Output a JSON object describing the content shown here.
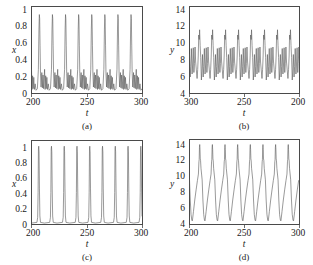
{
  "figure": {
    "panels": [
      {
        "id": "a",
        "label": "(a)",
        "xlabel": "t",
        "ylabel": "x",
        "xticks": [
          "200",
          "250",
          "300"
        ],
        "yticks": [
          "0",
          "0.2",
          "0.4",
          "0.6",
          "0.8",
          "1"
        ],
        "reversed_x": false
      },
      {
        "id": "b",
        "label": "(b)",
        "xlabel": "t",
        "ylabel": "y",
        "xticks": [
          "300",
          "250",
          "200"
        ],
        "yticks": [
          "4",
          "6",
          "8",
          "10",
          "12",
          "14"
        ],
        "reversed_x": true
      },
      {
        "id": "c",
        "label": "(c)",
        "xlabel": "t",
        "ylabel": "x",
        "xticks": [
          "200",
          "250",
          "300"
        ],
        "yticks": [
          "0",
          "0.2",
          "0.4",
          "0.6",
          "0.8",
          "1"
        ],
        "reversed_x": false
      },
      {
        "id": "d",
        "label": "(d)",
        "xlabel": "t",
        "ylabel": "y",
        "xticks": [
          "200",
          "250",
          "300"
        ],
        "yticks": [
          "4",
          "6",
          "8",
          "10",
          "12",
          "14"
        ],
        "reversed_x": false
      }
    ]
  },
  "chart_data": [
    {
      "type": "line",
      "panel": "a",
      "title": "",
      "xlabel": "t",
      "ylabel": "x",
      "xlim": [
        200,
        300
      ],
      "ylim": [
        0,
        1.08
      ],
      "xticks": [
        200,
        250,
        300
      ],
      "yticks": [
        0,
        0.2,
        0.4,
        0.6,
        0.8,
        1
      ],
      "grid": false,
      "legend": false,
      "description": "Eight large spikes reaching ~0.95-1.0 separated by low-amplitude double bumps near 0.15-0.25; period about 11.8 time units.",
      "series": [
        {
          "name": "x(t)",
          "color": "#555555",
          "period": 11.8,
          "waveform_cycle": [
            {
              "dt": 0.0,
              "y": 0.3
            },
            {
              "dt": 0.45,
              "y": 0.05
            },
            {
              "dt": 1.0,
              "y": 0.22
            },
            {
              "dt": 1.5,
              "y": 0.06
            },
            {
              "dt": 2.05,
              "y": 0.2
            },
            {
              "dt": 2.6,
              "y": 0.05
            },
            {
              "dt": 3.3,
              "y": 0.12
            },
            {
              "dt": 4.1,
              "y": 0.04
            },
            {
              "dt": 5.3,
              "y": 0.06
            },
            {
              "dt": 6.2,
              "y": 0.3
            },
            {
              "dt": 6.7,
              "y": 0.8
            },
            {
              "dt": 7.05,
              "y": 0.98
            },
            {
              "dt": 7.35,
              "y": 0.93
            },
            {
              "dt": 7.7,
              "y": 0.6
            },
            {
              "dt": 8.1,
              "y": 0.25
            },
            {
              "dt": 8.6,
              "y": 0.08
            },
            {
              "dt": 9.3,
              "y": 0.26
            },
            {
              "dt": 9.8,
              "y": 0.07
            },
            {
              "dt": 10.4,
              "y": 0.23
            },
            {
              "dt": 10.9,
              "y": 0.06
            },
            {
              "dt": 11.8,
              "y": 0.3
            }
          ]
        }
      ]
    },
    {
      "type": "line",
      "panel": "b",
      "title": "",
      "xlabel": "t",
      "ylabel": "y",
      "xlim": [
        300,
        200
      ],
      "ylim": [
        3.4,
        15.0
      ],
      "xticks": [
        300,
        250,
        200
      ],
      "yticks": [
        4,
        6,
        8,
        10,
        12,
        14
      ],
      "grid": false,
      "legend": false,
      "axis_note": "x axis is reversed, running from 300 on the left to 200 on the right",
      "description": "Irregular multi-peak oscillation: one tall peak near 12 followed by two or three intermediate peaks near 10, with troughs between 5 and 6.5; repeat interval about 11.8 units.",
      "series": [
        {
          "name": "y(t)",
          "color": "#555555",
          "period": 11.8,
          "waveform_cycle": [
            {
              "dt": 0.0,
              "y": 7.6
            },
            {
              "dt": 0.55,
              "y": 9.6
            },
            {
              "dt": 1.1,
              "y": 7.4
            },
            {
              "dt": 1.6,
              "y": 6.2
            },
            {
              "dt": 2.2,
              "y": 9.5
            },
            {
              "dt": 2.75,
              "y": 7.2
            },
            {
              "dt": 3.25,
              "y": 6.0
            },
            {
              "dt": 3.9,
              "y": 9.4
            },
            {
              "dt": 4.45,
              "y": 7.0
            },
            {
              "dt": 4.95,
              "y": 5.6
            },
            {
              "dt": 5.6,
              "y": 8.6
            },
            {
              "dt": 6.1,
              "y": 6.4
            },
            {
              "dt": 6.6,
              "y": 5.2
            },
            {
              "dt": 7.2,
              "y": 8.2
            },
            {
              "dt": 7.7,
              "y": 9.8
            },
            {
              "dt": 8.2,
              "y": 11.9
            },
            {
              "dt": 8.55,
              "y": 10.6
            },
            {
              "dt": 9.0,
              "y": 11.2
            },
            {
              "dt": 9.45,
              "y": 8.4
            },
            {
              "dt": 9.95,
              "y": 6.6
            },
            {
              "dt": 10.5,
              "y": 5.4
            },
            {
              "dt": 11.1,
              "y": 6.4
            },
            {
              "dt": 11.8,
              "y": 7.6
            }
          ]
        }
      ]
    },
    {
      "type": "line",
      "panel": "c",
      "title": "",
      "xlabel": "t",
      "ylabel": "x",
      "xlim": [
        200,
        300
      ],
      "ylim": [
        0,
        1.18
      ],
      "xticks": [
        200,
        250,
        300
      ],
      "yticks": [
        0,
        0.2,
        0.4,
        0.6,
        0.8,
        1
      ],
      "grid": false,
      "legend": false,
      "description": "Nine clean narrow spikes peaking slightly above 1.0 on a flat near-zero baseline; regular period about 11.5 time units, no secondary bumps.",
      "series": [
        {
          "name": "x(t)",
          "color": "#555555",
          "period": 11.5,
          "waveform_cycle": [
            {
              "dt": 0.0,
              "y": 0.02
            },
            {
              "dt": 4.9,
              "y": 0.03
            },
            {
              "dt": 5.55,
              "y": 0.1
            },
            {
              "dt": 5.95,
              "y": 0.45
            },
            {
              "dt": 6.25,
              "y": 1.06
            },
            {
              "dt": 6.5,
              "y": 1.1
            },
            {
              "dt": 6.8,
              "y": 1.02
            },
            {
              "dt": 7.15,
              "y": 0.5
            },
            {
              "dt": 7.55,
              "y": 0.12
            },
            {
              "dt": 8.1,
              "y": 0.03
            },
            {
              "dt": 11.5,
              "y": 0.02
            }
          ]
        }
      ]
    },
    {
      "type": "line",
      "panel": "d",
      "title": "",
      "xlabel": "t",
      "ylabel": "y",
      "xlim": [
        200,
        300
      ],
      "ylim": [
        3.2,
        15.0
      ],
      "xticks": [
        200,
        250,
        300
      ],
      "yticks": [
        4,
        6,
        8,
        10,
        12,
        14
      ],
      "grid": false,
      "legend": false,
      "description": "Regular sawtooth-like relaxation oscillation: slow rise from about 3.7 to a sharp narrow peak near 14.3, then rapid fall with a small notch around 12 on the descent; period about 11.5 units.",
      "series": [
        {
          "name": "y(t)",
          "color": "#555555",
          "period": 11.5,
          "waveform_cycle": [
            {
              "dt": 0.0,
              "y": 9.4
            },
            {
              "dt": 0.7,
              "y": 6.6
            },
            {
              "dt": 1.4,
              "y": 4.6
            },
            {
              "dt": 2.1,
              "y": 3.8
            },
            {
              "dt": 2.6,
              "y": 3.7
            },
            {
              "dt": 3.6,
              "y": 5.0
            },
            {
              "dt": 4.8,
              "y": 6.6
            },
            {
              "dt": 6.0,
              "y": 8.0
            },
            {
              "dt": 7.2,
              "y": 9.3
            },
            {
              "dt": 8.1,
              "y": 10.2
            },
            {
              "dt": 8.55,
              "y": 11.9
            },
            {
              "dt": 8.8,
              "y": 12.2
            },
            {
              "dt": 9.05,
              "y": 13.9
            },
            {
              "dt": 9.3,
              "y": 14.3
            },
            {
              "dt": 9.55,
              "y": 13.6
            },
            {
              "dt": 9.8,
              "y": 12.3
            },
            {
              "dt": 10.05,
              "y": 12.1
            },
            {
              "dt": 10.45,
              "y": 11.0
            },
            {
              "dt": 11.5,
              "y": 9.4
            }
          ]
        }
      ]
    }
  ]
}
